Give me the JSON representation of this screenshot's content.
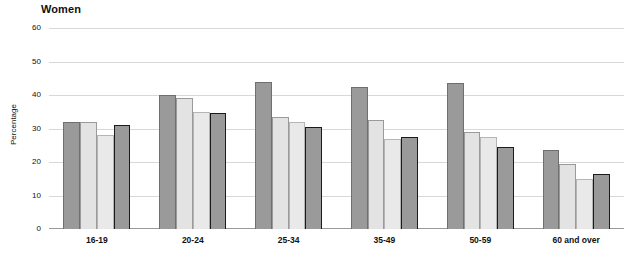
{
  "chart_data": {
    "type": "bar",
    "title": "Women",
    "subtitle": "",
    "xlabel": "",
    "ylabel": "Percentage",
    "ylim": [
      0,
      60
    ],
    "yticks": [
      0,
      10,
      20,
      30,
      40,
      50,
      60
    ],
    "ytick_labels": [
      "0",
      "10",
      "20",
      "30",
      "40",
      "50",
      "60"
    ],
    "grid": true,
    "legend_position": "none",
    "categories": [
      "16-19",
      "20-24",
      "25-34",
      "35-49",
      "50-59",
      "60 and over"
    ],
    "series": [
      {
        "name": "series-1",
        "color": "#9a9a9a",
        "values": [
          32,
          40,
          44,
          42.5,
          43.5,
          23.5
        ]
      },
      {
        "name": "series-2",
        "color": "#e3e3e3",
        "values": [
          32,
          39,
          33.5,
          32.5,
          29,
          19.5
        ]
      },
      {
        "name": "series-3",
        "color": "#e9e9e9",
        "values": [
          28,
          35,
          32,
          27,
          27.5,
          15
        ]
      },
      {
        "name": "series-4",
        "color": "#9a9a9a",
        "values": [
          31,
          34.5,
          30.5,
          27.5,
          24.5,
          16.5
        ]
      }
    ]
  }
}
